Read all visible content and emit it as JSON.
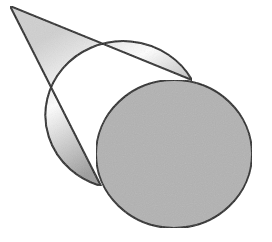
{
  "diagram": {
    "type": "cone",
    "colors": {
      "background": "#ffffff",
      "outline": "#1a1a1a",
      "base_fill": "#b0b0b0",
      "lateral_light": "#ffffff",
      "lateral_dark": "#9a9a9a"
    }
  }
}
